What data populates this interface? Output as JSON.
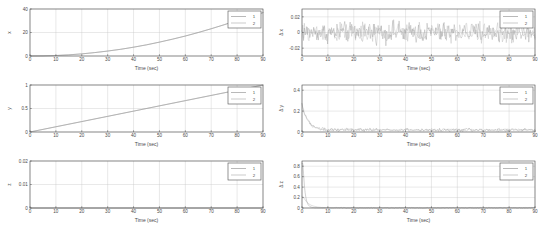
{
  "figure": {
    "background_color": "#ffffff",
    "axes_color": "#4d4d4d",
    "grid_color": "#c8c8c8",
    "series_colors": [
      "#8a8a8a",
      "#a8a8a8"
    ],
    "rows": 3,
    "cols": 2
  },
  "chart_data": [
    {
      "id": "plot-x-position",
      "type": "line",
      "title": "",
      "xlabel": "Time (sec)",
      "ylabel": "x",
      "xlim": [
        0,
        90
      ],
      "ylim": [
        0,
        40
      ],
      "xticks": [
        0,
        10,
        20,
        30,
        40,
        50,
        60,
        70,
        80,
        90
      ],
      "xticklabels": [
        "0",
        "10",
        "20",
        "30",
        "40",
        "50",
        "60",
        "70",
        "80",
        "90"
      ],
      "yticks": [
        0,
        20,
        40
      ],
      "yticklabels": [
        "0",
        "20",
        "40"
      ],
      "grid": true,
      "legend": [
        "1",
        "2"
      ],
      "legend_position": "upper right",
      "x": [
        0,
        5,
        10,
        15,
        20,
        25,
        30,
        35,
        40,
        45,
        50,
        55,
        60,
        65,
        70,
        75,
        80,
        85,
        90
      ],
      "series": [
        {
          "name": "1",
          "values": [
            0.0,
            0.1,
            0.4,
            1.0,
            1.8,
            2.9,
            4.2,
            5.7,
            7.5,
            9.5,
            11.8,
            14.3,
            17.0,
            20.0,
            23.2,
            26.6,
            30.3,
            33.6,
            36.9
          ]
        },
        {
          "name": "2",
          "values": [
            0.0,
            0.1,
            0.4,
            1.0,
            1.8,
            2.9,
            4.2,
            5.7,
            7.5,
            9.5,
            11.8,
            14.3,
            17.0,
            20.0,
            23.2,
            26.6,
            30.3,
            33.6,
            36.9
          ]
        }
      ]
    },
    {
      "id": "plot-x-error",
      "type": "line",
      "title": "",
      "xlabel": "Time (sec)",
      "ylabel": "Δ x",
      "xlim": [
        0,
        90
      ],
      "ylim": [
        -0.03,
        0.03
      ],
      "xticks": [
        0,
        10,
        20,
        30,
        40,
        50,
        60,
        70,
        80,
        90
      ],
      "xticklabels": [
        "0",
        "10",
        "20",
        "30",
        "40",
        "50",
        "60",
        "70",
        "80",
        "90"
      ],
      "yticks": [
        -0.02,
        0,
        0.02
      ],
      "yticklabels": [
        "-0.02",
        "0",
        "0.02"
      ],
      "grid": true,
      "legend": [
        "1",
        "2"
      ],
      "legend_position": "upper right",
      "noise_amplitude": 0.013,
      "noise_mean": 0.0,
      "sample_count": 300,
      "description": "zero-mean white noise band"
    },
    {
      "id": "plot-y-position",
      "type": "line",
      "title": "",
      "xlabel": "Time (sec)",
      "ylabel": "y",
      "xlim": [
        0,
        90
      ],
      "ylim": [
        0,
        1
      ],
      "xticks": [
        0,
        10,
        20,
        30,
        40,
        50,
        60,
        70,
        80,
        90
      ],
      "xticklabels": [
        "0",
        "10",
        "20",
        "30",
        "40",
        "50",
        "60",
        "70",
        "80",
        "90"
      ],
      "yticks": [
        0,
        0.5,
        1
      ],
      "yticklabels": [
        "0",
        "0.5",
        "1"
      ],
      "grid": true,
      "legend": [
        "1",
        "2"
      ],
      "legend_position": "upper right",
      "x": [
        0,
        10,
        20,
        30,
        40,
        50,
        60,
        70,
        80,
        90
      ],
      "series": [
        {
          "name": "1",
          "values": [
            0.0,
            0.111,
            0.222,
            0.333,
            0.444,
            0.556,
            0.667,
            0.778,
            0.889,
            1.0
          ]
        },
        {
          "name": "2",
          "values": [
            0.0,
            0.111,
            0.222,
            0.333,
            0.444,
            0.556,
            0.667,
            0.778,
            0.889,
            1.0
          ]
        }
      ]
    },
    {
      "id": "plot-y-error",
      "type": "line",
      "title": "",
      "xlabel": "Time (sec)",
      "ylabel": "Δ y",
      "xlim": [
        0,
        90
      ],
      "ylim": [
        0,
        0.45
      ],
      "xticks": [
        0,
        10,
        20,
        30,
        40,
        50,
        60,
        70,
        80,
        90
      ],
      "xticklabels": [
        "0",
        "10",
        "20",
        "30",
        "40",
        "50",
        "60",
        "70",
        "80",
        "90"
      ],
      "yticks": [
        0,
        0.2,
        0.4
      ],
      "yticklabels": [
        "0",
        "0.2",
        "0.4"
      ],
      "grid": true,
      "legend": [
        "1",
        "2"
      ],
      "legend_position": "upper right",
      "initial_peak": 0.25,
      "steady_state": 0.02,
      "noise_amplitude": 0.022,
      "sample_count": 300,
      "description": "initial transient spike decaying to low-level noise"
    },
    {
      "id": "plot-z-position",
      "type": "line",
      "title": "",
      "xlabel": "Time (sec)",
      "ylabel": "z",
      "xlim": [
        0,
        90
      ],
      "ylim": [
        0,
        0.02
      ],
      "xticks": [
        0,
        10,
        20,
        30,
        40,
        50,
        60,
        70,
        80,
        90
      ],
      "xticklabels": [
        "0",
        "10",
        "20",
        "30",
        "40",
        "50",
        "60",
        "70",
        "80",
        "90"
      ],
      "yticks": [
        0,
        0.01,
        0.02
      ],
      "yticklabels": [
        "0",
        "0.01",
        "0.02"
      ],
      "grid": true,
      "legend": [
        "1",
        "2"
      ],
      "legend_position": "upper right",
      "x": [
        0,
        90
      ],
      "series": [
        {
          "name": "1",
          "values": [
            0.0,
            0.0
          ]
        },
        {
          "name": "2",
          "values": [
            0.0,
            0.0
          ]
        }
      ],
      "description": "flat zero trace along the bottom axis"
    },
    {
      "id": "plot-z-error",
      "type": "line",
      "title": "",
      "xlabel": "Time (sec)",
      "ylabel": "Δ z",
      "xlim": [
        0,
        90
      ],
      "ylim": [
        0,
        0.9
      ],
      "xticks": [
        0,
        10,
        20,
        30,
        40,
        50,
        60,
        70,
        80,
        90
      ],
      "xticklabels": [
        "0",
        "10",
        "20",
        "30",
        "40",
        "50",
        "60",
        "70",
        "80",
        "90"
      ],
      "yticks": [
        0,
        0.2,
        0.4,
        0.6,
        0.8
      ],
      "yticklabels": [
        "0",
        "0.2",
        "0.4",
        "0.6",
        "0.8"
      ],
      "grid": true,
      "legend": [
        "1",
        "2"
      ],
      "legend_position": "upper right",
      "initial_peak": 0.85,
      "secondary_peak": 0.22,
      "steady_state": 0.01,
      "decay_time": 8,
      "sample_count": 300,
      "description": "sharp transient spike near t=1 decaying to near zero by t=10"
    }
  ]
}
